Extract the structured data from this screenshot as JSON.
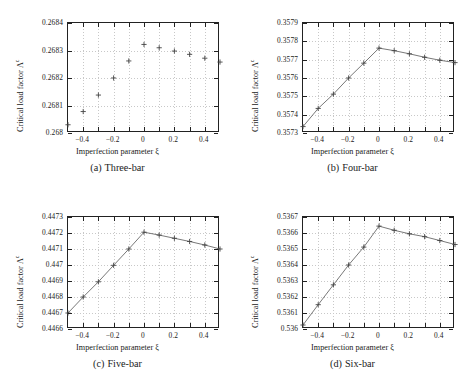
{
  "figure": {
    "axis_label_x": "Imperfection parameter ξ",
    "axis_label_y_main": "Critical load factor",
    "axis_label_y_symbol": "Λ",
    "axis_label_y_exponent": "c",
    "marker_color": "#444444",
    "line_color": "#555555",
    "grid_color": "#c8c8c8",
    "frame_color": "#222222"
  },
  "chart_data": [
    {
      "type": "scatter",
      "panel": "a",
      "caption_letter": "(a)",
      "caption_text": "Three-bar",
      "title": "",
      "xlabel": "Imperfection parameter ξ",
      "ylabel": "Critical load factor Λc",
      "grid": true,
      "connected": false,
      "xlim": [
        -0.5,
        0.5
      ],
      "ylim": [
        0.268,
        0.2684
      ],
      "xticks": [
        -0.4,
        -0.2,
        0,
        0.2,
        0.4
      ],
      "xticklabels": [
        "-0.4",
        "-0.2",
        "0",
        "0.2",
        "0.4"
      ],
      "yticks": [
        0.268,
        0.2681,
        0.2682,
        0.2683,
        0.2684
      ],
      "yticklabels": [
        "0.268",
        "0.2681",
        "0.2682",
        "0.2683",
        "0.2684"
      ],
      "x": [
        -0.5,
        -0.4,
        -0.3,
        -0.2,
        -0.1,
        0.0,
        0.1,
        0.2,
        0.3,
        0.4,
        0.5
      ],
      "values": [
        0.26803,
        0.268078,
        0.268138,
        0.2682,
        0.268262,
        0.268322,
        0.26831,
        0.268298,
        0.268286,
        0.268272,
        0.268258
      ]
    },
    {
      "type": "line",
      "panel": "b",
      "caption_letter": "(b)",
      "caption_text": "Four-bar",
      "title": "",
      "xlabel": "Imperfection parameter ξ",
      "ylabel": "Critical load factor Λc",
      "grid": true,
      "connected": true,
      "xlim": [
        -0.5,
        0.5
      ],
      "ylim": [
        0.3573,
        0.3579
      ],
      "xticks": [
        -0.4,
        -0.2,
        0,
        0.2,
        0.4
      ],
      "xticklabels": [
        "-0.4",
        "-0.2",
        "0",
        "0.2",
        "0.4"
      ],
      "yticks": [
        0.3573,
        0.3574,
        0.3575,
        0.3576,
        0.3577,
        0.3578,
        0.3579
      ],
      "yticklabels": [
        "0.3573",
        "0.3574",
        "0.3575",
        "0.3576",
        "0.3577",
        "0.3578",
        "0.3579"
      ],
      "x": [
        -0.5,
        -0.4,
        -0.3,
        -0.2,
        -0.1,
        0.0,
        0.1,
        0.2,
        0.3,
        0.4,
        0.5
      ],
      "values": [
        0.357335,
        0.357434,
        0.357512,
        0.3576,
        0.357681,
        0.357763,
        0.357749,
        0.357732,
        0.357713,
        0.357697,
        0.357684
      ]
    },
    {
      "type": "line",
      "panel": "c",
      "caption_letter": "(c)",
      "caption_text": "Five-bar",
      "title": "",
      "xlabel": "Imperfection parameter ξ",
      "ylabel": "Critical load factor Λc",
      "grid": true,
      "connected": true,
      "xlim": [
        -0.5,
        0.5
      ],
      "ylim": [
        0.4466,
        0.4473
      ],
      "xticks": [
        -0.4,
        -0.2,
        0,
        0.2,
        0.4
      ],
      "xticklabels": [
        "-0.4",
        "-0.2",
        "0",
        "0.2",
        "0.4"
      ],
      "yticks": [
        0.4466,
        0.4467,
        0.4468,
        0.4469,
        0.447,
        0.4471,
        0.4472,
        0.4473
      ],
      "yticklabels": [
        "0.4466",
        "0.4467",
        "0.4468",
        "0.4469",
        "0.447",
        "0.4471",
        "0.4472",
        "0.4473"
      ],
      "x": [
        -0.5,
        -0.4,
        -0.3,
        -0.2,
        -0.1,
        0.0,
        0.1,
        0.2,
        0.3,
        0.4,
        0.5
      ],
      "values": [
        0.4467,
        0.4468,
        0.446895,
        0.446998,
        0.4471,
        0.447205,
        0.447187,
        0.447167,
        0.447147,
        0.447125,
        0.4471
      ]
    },
    {
      "type": "line",
      "panel": "d",
      "caption_letter": "(d)",
      "caption_text": "Six-bar",
      "title": "",
      "xlabel": "Imperfection parameter ξ",
      "ylabel": "Critical load factor Λc",
      "grid": true,
      "connected": true,
      "xlim": [
        -0.5,
        0.5
      ],
      "ylim": [
        0.536,
        0.5367
      ],
      "xticks": [
        -0.4,
        -0.2,
        0,
        0.2,
        0.4
      ],
      "xticklabels": [
        "-0.4",
        "-0.2",
        "0",
        "0.2",
        "0.4"
      ],
      "yticks": [
        0.536,
        0.5361,
        0.5362,
        0.5363,
        0.5364,
        0.5365,
        0.5366,
        0.5367
      ],
      "yticklabels": [
        "0.536",
        "0.5361",
        "0.5362",
        "0.5363",
        "0.5364",
        "0.5365",
        "0.5366",
        "0.5367"
      ],
      "x": [
        -0.5,
        -0.4,
        -0.3,
        -0.2,
        -0.1,
        0.0,
        0.1,
        0.2,
        0.3,
        0.4,
        0.5
      ],
      "values": [
        0.536025,
        0.536152,
        0.536276,
        0.5364,
        0.536512,
        0.536643,
        0.536617,
        0.536595,
        0.536577,
        0.536553,
        0.536528
      ]
    }
  ]
}
